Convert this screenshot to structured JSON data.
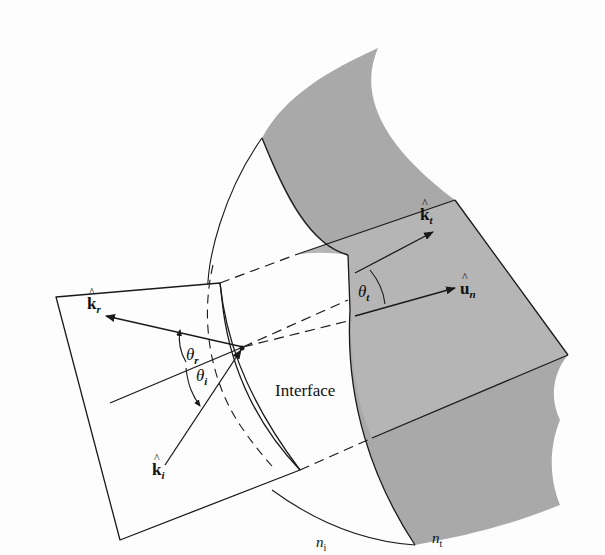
{
  "figure": {
    "colors": {
      "background": "#fdfdfd",
      "medium_t_fill": "#a9a9a9",
      "plane_fill": "#b3b3b3",
      "line": "#1a1a1a"
    }
  },
  "labels": {
    "k_r": {
      "symbol": "k",
      "sub": "r"
    },
    "k_i": {
      "symbol": "k",
      "sub": "i"
    },
    "k_t": {
      "symbol": "k",
      "sub": "t"
    },
    "u_n": {
      "symbol": "u",
      "sub": "n"
    },
    "theta_r": {
      "symbol": "θ",
      "sub": "r"
    },
    "theta_i": {
      "symbol": "θ",
      "sub": "i"
    },
    "theta_t": {
      "symbol": "θ",
      "sub": "t"
    },
    "interface": "Interface",
    "n_i": {
      "symbol": "n",
      "sub": "i"
    },
    "n_t": {
      "symbol": "n",
      "sub": "t"
    },
    "hat": "^"
  }
}
